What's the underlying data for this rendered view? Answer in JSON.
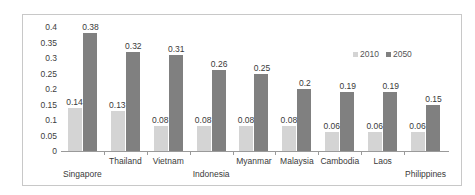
{
  "chart_data": {
    "type": "bar",
    "title": "",
    "subtitle": "",
    "xlabel": "",
    "ylabel": "",
    "ylim": [
      0,
      0.4
    ],
    "grid": false,
    "legend_position": "top-right",
    "categories": [
      "Singapore",
      "Thailand",
      "Vietnam",
      "Indonesia",
      "Myanmar",
      "Malaysia",
      "Cambodia",
      "Laos",
      "Philippines"
    ],
    "y_ticks": [
      "0",
      "0.05",
      "0.1",
      "0.15",
      "0.2",
      "0.25",
      "0.3",
      "0.35",
      "0.4"
    ],
    "y_tick_values": [
      0,
      0.05,
      0.1,
      0.15,
      0.2,
      0.25,
      0.3,
      0.35,
      0.4
    ],
    "series": [
      {
        "name": "2010",
        "color": "#d4d4d4",
        "values": [
          0.14,
          0.13,
          0.08,
          0.08,
          0.08,
          0.08,
          0.06,
          0.06,
          0.06
        ],
        "labels": [
          "0.14",
          "0.13",
          "0.08",
          "0.08",
          "0.08",
          "0.08",
          "0.06",
          "0.06",
          "0.06"
        ]
      },
      {
        "name": "2050",
        "color": "#808080",
        "values": [
          0.38,
          0.32,
          0.31,
          0.26,
          0.25,
          0.2,
          0.19,
          0.19,
          0.15
        ],
        "labels": [
          "0.38",
          "0.32",
          "0.31",
          "0.26",
          "0.25",
          "0.2",
          "0.19",
          "0.19",
          "0.15"
        ]
      }
    ]
  },
  "legend": {
    "items": [
      {
        "label": "2010"
      },
      {
        "label": "2050"
      }
    ]
  }
}
